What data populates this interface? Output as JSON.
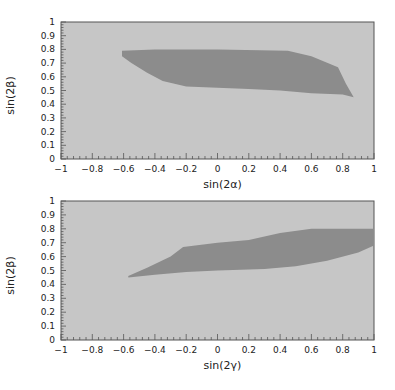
{
  "colors": {
    "page_background": "#ffffff",
    "plot_background": "#c6c6c6",
    "region_fill": "#8c8c8c",
    "axis": "#555555",
    "text": "#222222"
  },
  "chart_data": [
    {
      "type": "area",
      "title": "",
      "xlabel": "sin(2α)",
      "ylabel": "sin(2β)",
      "xlim": [
        -1,
        1
      ],
      "ylim": [
        0,
        1
      ],
      "xticks": [
        "-1",
        "-0.8",
        "-0.6",
        "-0.4",
        "-0.2",
        "0",
        "0.2",
        "0.4",
        "0.6",
        "0.8",
        "1"
      ],
      "yticks": [
        "0",
        "0.1",
        "0.2",
        "0.3",
        "0.4",
        "0.5",
        "0.6",
        "0.7",
        "0.8",
        "0.9",
        "1"
      ],
      "grid": false,
      "legend": null,
      "region": {
        "description": "allowed region (dark shaded)",
        "boundary": [
          [
            -0.61,
            0.79
          ],
          [
            -0.4,
            0.8
          ],
          [
            0.0,
            0.8
          ],
          [
            0.45,
            0.79
          ],
          [
            0.6,
            0.75
          ],
          [
            0.77,
            0.67
          ],
          [
            0.82,
            0.55
          ],
          [
            0.87,
            0.45
          ],
          [
            0.8,
            0.47
          ],
          [
            0.6,
            0.48
          ],
          [
            0.4,
            0.5
          ],
          [
            0.2,
            0.51
          ],
          [
            0.0,
            0.52
          ],
          [
            -0.2,
            0.53
          ],
          [
            -0.35,
            0.57
          ],
          [
            -0.45,
            0.63
          ],
          [
            -0.55,
            0.7
          ],
          [
            -0.61,
            0.75
          ]
        ]
      }
    },
    {
      "type": "area",
      "title": "",
      "xlabel": "sin(2γ)",
      "ylabel": "sin(2β)",
      "xlim": [
        -1,
        1
      ],
      "ylim": [
        0,
        1
      ],
      "xticks": [
        "-1",
        "-0.8",
        "-0.6",
        "-0.4",
        "-0.2",
        "0",
        "0.2",
        "0.4",
        "0.6",
        "0.8",
        "1"
      ],
      "yticks": [
        "0",
        "0.1",
        "0.2",
        "0.3",
        "0.4",
        "0.5",
        "0.6",
        "0.7",
        "0.8",
        "0.9",
        "1"
      ],
      "grid": false,
      "legend": null,
      "region": {
        "description": "allowed region (dark shaded)",
        "boundary": [
          [
            -0.57,
            0.46
          ],
          [
            -0.45,
            0.52
          ],
          [
            -0.3,
            0.6
          ],
          [
            -0.22,
            0.67
          ],
          [
            0.0,
            0.7
          ],
          [
            0.2,
            0.72
          ],
          [
            0.4,
            0.77
          ],
          [
            0.6,
            0.8
          ],
          [
            0.8,
            0.8
          ],
          [
            1.0,
            0.8
          ],
          [
            1.0,
            0.68
          ],
          [
            0.9,
            0.63
          ],
          [
            0.7,
            0.57
          ],
          [
            0.5,
            0.53
          ],
          [
            0.3,
            0.51
          ],
          [
            0.0,
            0.5
          ],
          [
            -0.2,
            0.49
          ],
          [
            -0.4,
            0.47
          ],
          [
            -0.57,
            0.45
          ]
        ]
      }
    }
  ]
}
